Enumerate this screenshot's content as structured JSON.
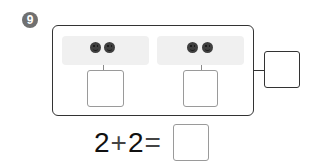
{
  "problem": {
    "number": "9",
    "badge_color": "#707070",
    "groups": [
      {
        "count": 2,
        "icon": "smiley-face-icon"
      },
      {
        "count": 2,
        "icon": "smiley-face-icon"
      }
    ],
    "equation": {
      "operand1": "2",
      "operator": "+",
      "operand2": "2",
      "equals": "=",
      "answer": ""
    },
    "answer_boxes": {
      "group_left": "",
      "group_right": "",
      "total": "",
      "equation_result": ""
    }
  }
}
